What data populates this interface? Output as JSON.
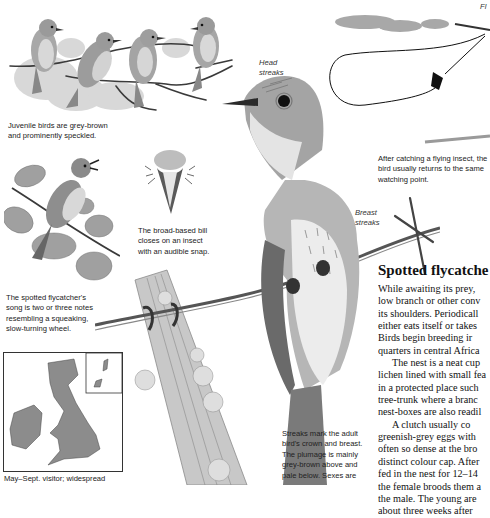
{
  "page": {
    "type": "field-guide-page",
    "species_title": "Spotted flycatche"
  },
  "illustrations": {
    "juveniles": {
      "label": "juvenile-birds-on-branch",
      "count": 4
    },
    "singing_bird": {
      "label": "singing-bird-on-twig"
    },
    "bill_closeup": {
      "label": "broad-based-bill-front-view"
    },
    "main_bird": {
      "label": "adult-spotted-flycatcher-on-barbed-wire"
    },
    "fence_post": {
      "label": "lichen-covered-fence-post"
    },
    "flight_path": {
      "label": "flight-loop-diagram"
    },
    "range_map": {
      "label": "british-isles-range-map"
    }
  },
  "labels": {
    "head_streaks": [
      "Head",
      "streaks"
    ],
    "breast_streaks": [
      "Breast",
      "streaks"
    ],
    "fl_fragment": "Fl"
  },
  "captions": {
    "juveniles": [
      "Juvenile birds are grey-brown",
      "and prominently speckled."
    ],
    "bill": [
      "The broad-based bill",
      "closes on an insect",
      "with an audible snap."
    ],
    "song": [
      "The spotted flycatcher's",
      "song is two or three notes",
      "resembling a squeaking,",
      "slow-turning wheel."
    ],
    "flight": [
      "After catching a flying insect, the",
      "bird usually returns to the same",
      "watching point."
    ],
    "streaks": [
      "Streaks mark the adult",
      "bird's crown and breast.",
      "The plumage is mainly",
      "grey-brown above and",
      "pale below. Sexes are"
    ],
    "map": [
      "May–Sept. visitor; widespread"
    ]
  },
  "article": {
    "heading": "Spotted flycatche",
    "lines": [
      "While awaiting its prey,",
      "low branch or other conv",
      "its shoulders. Periodicall",
      "either eats itself or takes",
      "Birds begin breeding ir",
      "quarters in central Africa",
      "The nest is a neat cup",
      "lichen lined with small fea",
      "in a protected place such",
      "tree-trunk where a branc",
      "nest-boxes are also readil",
      "A clutch usually co",
      "greenish-grey eggs with",
      "often so dense at the bro",
      "distinct colour cap. After",
      "fed in the nest for 12–14",
      "the female broods them a",
      "the male. The young are",
      "about three weeks after"
    ],
    "indented_line_indices": [
      6,
      11
    ]
  },
  "colors": {
    "ink": "#1a1a1a",
    "pencil_dark": "#4a4a4a",
    "pencil_mid": "#8a8a8a",
    "pencil_light": "#c4c4c4",
    "map_fill": "#8c8c8c",
    "paper": "#ffffff"
  }
}
